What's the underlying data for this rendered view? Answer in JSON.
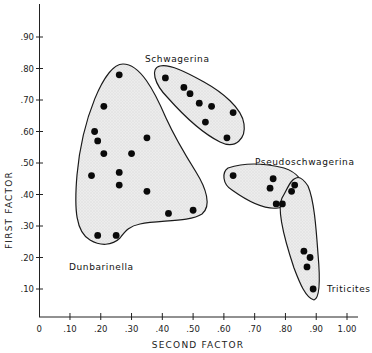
{
  "chart_data": {
    "type": "scatter",
    "title": "",
    "xlabel": "SECOND FACTOR",
    "ylabel": "FIRST FACTOR",
    "xlim": [
      0,
      1.05
    ],
    "ylim": [
      0,
      1.0
    ],
    "grid": false,
    "legend": "none (groups labeled directly on plot)",
    "x_ticks": [
      "0",
      ".10",
      ".20",
      ".30",
      ".40",
      ".50",
      ".60",
      ".70",
      ".80",
      ".90",
      "1.00"
    ],
    "y_ticks": [
      ".10",
      ".20",
      ".30",
      ".40",
      ".50",
      ".60",
      ".70",
      ".80",
      ".90"
    ],
    "series": [
      {
        "name": "Dunbarinella",
        "points": [
          [
            0.26,
            0.78
          ],
          [
            0.21,
            0.68
          ],
          [
            0.18,
            0.6
          ],
          [
            0.19,
            0.57
          ],
          [
            0.21,
            0.53
          ],
          [
            0.35,
            0.58
          ],
          [
            0.3,
            0.53
          ],
          [
            0.17,
            0.46
          ],
          [
            0.26,
            0.47
          ],
          [
            0.26,
            0.43
          ],
          [
            0.35,
            0.41
          ],
          [
            0.42,
            0.34
          ],
          [
            0.5,
            0.35
          ],
          [
            0.19,
            0.27
          ],
          [
            0.25,
            0.27
          ]
        ]
      },
      {
        "name": "Schwagerina",
        "points": [
          [
            0.41,
            0.77
          ],
          [
            0.47,
            0.74
          ],
          [
            0.49,
            0.72
          ],
          [
            0.52,
            0.69
          ],
          [
            0.56,
            0.68
          ],
          [
            0.63,
            0.66
          ],
          [
            0.54,
            0.63
          ],
          [
            0.61,
            0.58
          ]
        ]
      },
      {
        "name": "Pseudoschwagerina",
        "points": [
          [
            0.63,
            0.46
          ],
          [
            0.76,
            0.45
          ],
          [
            0.75,
            0.42
          ],
          [
            0.83,
            0.43
          ],
          [
            0.82,
            0.41
          ],
          [
            0.77,
            0.37
          ],
          [
            0.79,
            0.37
          ]
        ]
      },
      {
        "name": "Triticites",
        "points": [
          [
            0.86,
            0.22
          ],
          [
            0.88,
            0.2
          ],
          [
            0.87,
            0.17
          ],
          [
            0.89,
            0.1
          ]
        ]
      }
    ],
    "annotations": [
      {
        "text": "Dunbarinella",
        "x": 0.1,
        "y": 0.17
      },
      {
        "text": "Schwagerina",
        "x": 0.38,
        "y": 0.87
      },
      {
        "text": "Pseudoschwagerina",
        "x": 0.61,
        "y": 0.5
      },
      {
        "text": "Triticites",
        "x": 0.93,
        "y": 0.1
      }
    ]
  },
  "labels": {
    "xlabel": "SECOND FACTOR",
    "ylabel": "FIRST FACTOR",
    "dunbarinella": "Dunbarinella",
    "schwagerina": "Schwagerina",
    "pseudoschwagerina": "Pseudoschwagerina",
    "triticites": "Triticites",
    "x_ticks": [
      "0",
      ".10",
      ".20",
      ".30",
      ".40",
      ".50",
      ".60",
      ".70",
      ".80",
      ".90",
      "1.00"
    ],
    "y_ticks": [
      ".10",
      ".20",
      ".30",
      ".40",
      ".50",
      ".60",
      ".70",
      ".80",
      ".90"
    ]
  },
  "style": {
    "fill": "#e6e6e6",
    "stroke": "#1a1a1a",
    "point": "#0a0a0a"
  }
}
